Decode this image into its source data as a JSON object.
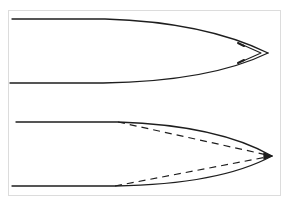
{
  "diagram": {
    "colors": {
      "line": "#1e1e1e",
      "frame": "#dcdcdc",
      "background": "#ffffff"
    },
    "upper_shape": {
      "label": "Curved profile with inner tip chevron",
      "top_edge": {
        "start": [
          12,
          19
        ],
        "taper_start": [
          105,
          19
        ]
      },
      "bottom_edge": {
        "start": [
          10,
          83
        ],
        "taper_start": [
          103,
          83
        ]
      },
      "tip": [
        268,
        53
      ],
      "inner_chevron": [
        [
          243,
          45
        ],
        [
          261,
          53
        ],
        [
          243,
          61
        ]
      ]
    },
    "lower_shape": {
      "label": "Curved profile with dashed straight-line approximation",
      "top_edge": {
        "start": [
          16,
          122
        ],
        "taper_start": [
          118,
          122
        ]
      },
      "bottom_edge": {
        "start": [
          12,
          186
        ],
        "taper_start": [
          115,
          186
        ]
      },
      "tip": [
        272,
        156
      ],
      "dashed_lines": [
        {
          "from": [
            118,
            122
          ],
          "to": [
            272,
            156
          ]
        },
        {
          "from": [
            115,
            186
          ],
          "to": [
            272,
            156
          ]
        }
      ]
    }
  }
}
